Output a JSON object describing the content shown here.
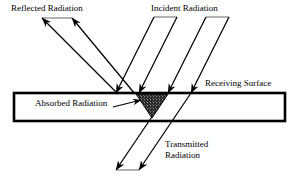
{
  "diagram": {
    "background_color": "#ffffff",
    "line_color": "#000000",
    "labels": {
      "reflected": "Reflected Radiation",
      "incident": "Incident Radiation",
      "receiving_surface": "Receiving Surface",
      "absorbed": "Absorbed Radiation",
      "transmitted_line1": "Transmitted",
      "transmitted_line2": "Radiation"
    },
    "elements": {
      "surface_slab": "receiving-surface-slab",
      "absorption_zone": "absorbed-radiation-triangle",
      "incident_ray_count": 4,
      "reflected_ray_count": 2,
      "transmitted_ray_count": 2
    }
  }
}
